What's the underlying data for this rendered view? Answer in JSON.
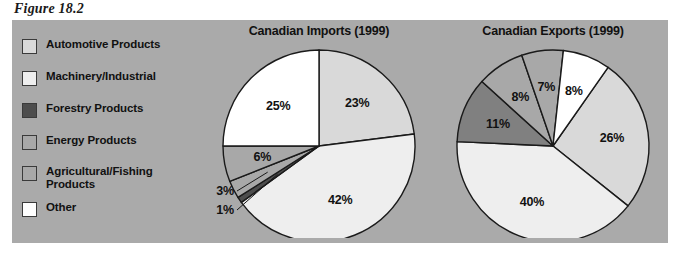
{
  "figure": {
    "caption": "Figure 18.2"
  },
  "legend": {
    "items": [
      {
        "label": "Automotive Products",
        "color": "#d9d9d9",
        "top": 0
      },
      {
        "label": "Machinery/Industrial",
        "color": "#eeeeee",
        "top": 32
      },
      {
        "label": "Forestry Products",
        "color": "#4d4d4d",
        "top": 64
      },
      {
        "label": "Energy Products",
        "color": "#a8a8a8",
        "top": 96
      },
      {
        "label": "Agricultural/Fishing\nProducts",
        "color": "#a8a8a8",
        "top": 127
      },
      {
        "label": "Other",
        "color": "#ffffff",
        "top": 163
      }
    ]
  },
  "chart_data": [
    {
      "type": "pie",
      "title": "Canadian Imports (1999)",
      "categories": [
        "Automotive Products",
        "Machinery/Industrial",
        "Forestry Products",
        "Energy Products",
        "Agricultural/Fishing Products",
        "Other"
      ],
      "values": [
        23,
        42,
        1,
        3,
        6,
        25
      ],
      "labels": [
        "23%",
        "42%",
        "1%",
        "3%",
        "6%",
        "25%"
      ],
      "colors": [
        "#d9d9d9",
        "#eeeeee",
        "#4d4d4d",
        "#a8a8a8",
        "#a8a8a8",
        "#ffffff"
      ],
      "start_angle_deg": 0,
      "direction": "clockwise",
      "legend_position": "left-external",
      "grid": false
    },
    {
      "type": "pie",
      "title": "Canadian Exports (1999)",
      "categories": [
        "Automotive Products",
        "Machinery/Industrial",
        "Forestry Products",
        "Energy Products",
        "Agricultural/Fishing Products",
        "Other"
      ],
      "values": [
        26,
        40,
        11,
        8,
        7,
        8
      ],
      "labels": [
        "26%",
        "40%",
        "11%",
        "8%",
        "7%",
        "8%"
      ],
      "colors": [
        "#d9d9d9",
        "#eeeeee",
        "#808080",
        "#a8a8a8",
        "#a8a8a8",
        "#ffffff"
      ],
      "start_angle_deg": 35,
      "direction": "clockwise",
      "legend_position": "left-external",
      "grid": false
    }
  ],
  "colors": {
    "panel_background": "#aaaaaa",
    "page_background": "#ffffff",
    "outline": "#1a1a1a",
    "text": "#111111"
  }
}
